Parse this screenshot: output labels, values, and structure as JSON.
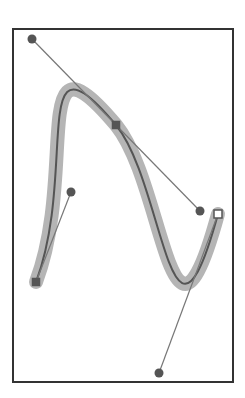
{
  "diagram": {
    "type": "bezier-path-editor",
    "frame": {
      "x": 13,
      "y": 29,
      "width": 220,
      "height": 353,
      "stroke": "#333333"
    },
    "path": {
      "d": "M36,282 C78,170 28,20 116,125 C165,185 170,390 218,214",
      "stroke": "#555555",
      "highlight_stroke": "#b5b5b5",
      "highlight_width": 14
    },
    "anchors": [
      {
        "name": "start-anchor",
        "x": 36,
        "y": 282,
        "shape": "square",
        "selected": false
      },
      {
        "name": "middle-anchor",
        "x": 116,
        "y": 125,
        "shape": "square",
        "selected": false
      },
      {
        "name": "end-anchor",
        "x": 218,
        "y": 214,
        "shape": "square",
        "selected": true
      }
    ],
    "handles": [
      {
        "name": "start-out-handle",
        "from": [
          36,
          282
        ],
        "to": [
          71,
          192
        ]
      },
      {
        "name": "middle-in-handle",
        "from": [
          116,
          125
        ],
        "to": [
          32,
          39
        ]
      },
      {
        "name": "middle-out-handle",
        "from": [
          116,
          125
        ],
        "to": [
          200,
          211
        ]
      },
      {
        "name": "end-in-handle",
        "from": [
          218,
          214
        ],
        "to": [
          159,
          373
        ]
      }
    ],
    "colors": {
      "handle_line": "#777777",
      "handle_point": "#555555",
      "anchor_fill": "#555555",
      "selected_fill": "#ffffff"
    }
  }
}
